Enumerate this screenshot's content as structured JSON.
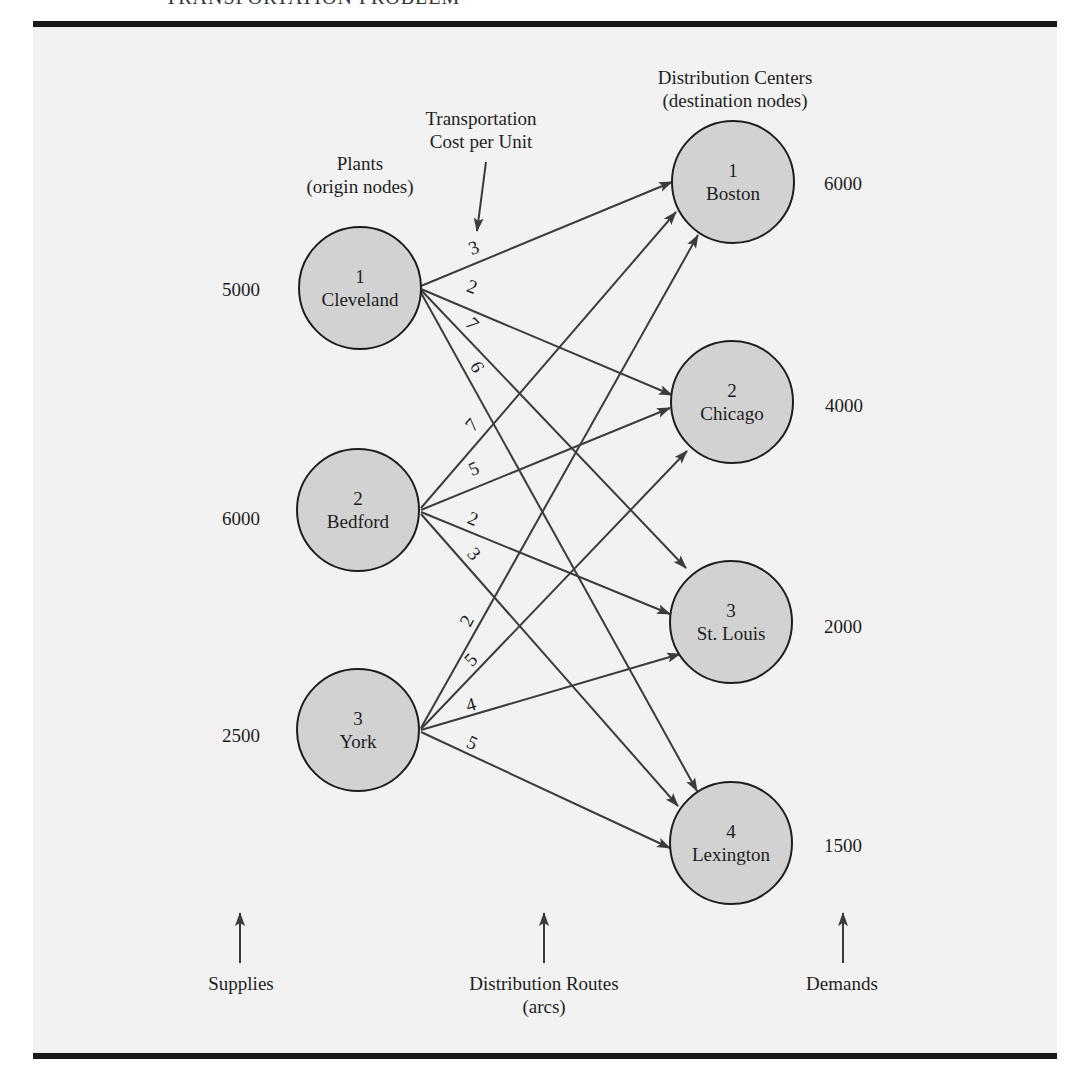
{
  "header": {
    "title": "TRANSPORTATION PROBLEM"
  },
  "labels": {
    "plants_line1": "Plants",
    "plants_line2": "(origin nodes)",
    "centers_line1": "Distribution Centers",
    "centers_line2": "(destination nodes)",
    "cost_line1": "Transportation",
    "cost_line2": "Cost per Unit",
    "supplies": "Supplies",
    "routes_line1": "Distribution Routes",
    "routes_line2": "(arcs)",
    "demands": "Demands"
  },
  "origins": [
    {
      "id": "1",
      "name": "Cleveland",
      "supply": "5000"
    },
    {
      "id": "2",
      "name": "Bedford",
      "supply": "6000"
    },
    {
      "id": "3",
      "name": "York",
      "supply": "2500"
    }
  ],
  "destinations": [
    {
      "id": "1",
      "name": "Boston",
      "demand": "6000"
    },
    {
      "id": "2",
      "name": "Chicago",
      "demand": "4000"
    },
    {
      "id": "3",
      "name": "St. Louis",
      "demand": "2000"
    },
    {
      "id": "4",
      "name": "Lexington",
      "demand": "1500"
    }
  ],
  "costs": {
    "cleveland": {
      "boston": "3",
      "chicago": "2",
      "st_louis": "7",
      "lexington": "6"
    },
    "bedford": {
      "boston": "7",
      "chicago": "5",
      "st_louis": "2",
      "lexington": "3"
    },
    "york": {
      "boston": "2",
      "chicago": "5",
      "st_louis": "4",
      "lexington": "5"
    }
  },
  "colors": {
    "node_fill": "#d2d2d2",
    "panel": "#f2f2f2",
    "line": "#3c3c3c",
    "rule": "#1a1a1a"
  }
}
